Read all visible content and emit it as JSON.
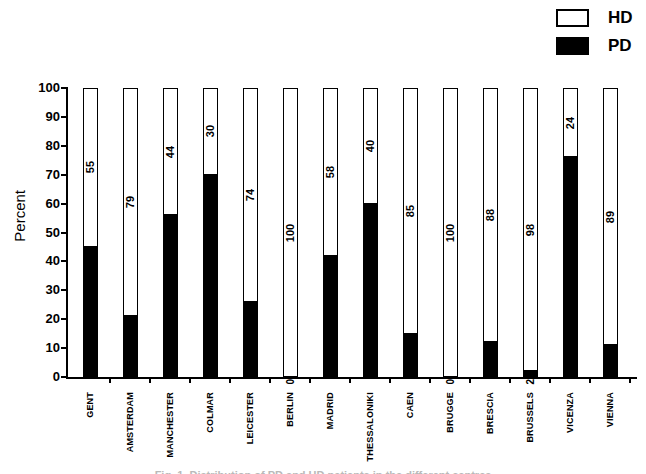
{
  "figure": {
    "legend": {
      "position": "top-right",
      "entries": [
        {
          "label": "HD",
          "fill": "#ffffff",
          "border": "#000000"
        },
        {
          "label": "PD",
          "fill": "#000000",
          "border": "#000000"
        }
      ]
    },
    "caption_clipped": "Fig. 1. Distribution of PD and HD patients in the different centres"
  },
  "chart_data": {
    "type": "bar",
    "stacked": true,
    "orientation": "vertical",
    "title": "",
    "xlabel": "",
    "ylabel": "Percent",
    "ylim": [
      0,
      100
    ],
    "yticks": [
      0,
      10,
      20,
      30,
      40,
      50,
      60,
      70,
      80,
      90,
      100
    ],
    "grid": false,
    "legend_position": "top-right",
    "categories": [
      "GENT",
      "AMSTERDAM",
      "MANCHESTER",
      "COLMAR",
      "LEICESTER",
      "BERLIN",
      "MADRID",
      "THESSALONIKI",
      "CAEN",
      "BRUGGE",
      "BRESCIA",
      "BRUSSELS",
      "VICENZA",
      "VIENNA"
    ],
    "series": [
      {
        "name": "PD",
        "fill": "#000000",
        "values": [
          45,
          21,
          56,
          70,
          26,
          0,
          42,
          60,
          15,
          0,
          12,
          2,
          76,
          11
        ]
      },
      {
        "name": "HD",
        "fill": "#ffffff",
        "values": [
          55,
          79,
          44,
          30,
          74,
          100,
          58,
          40,
          85,
          100,
          88,
          98,
          24,
          89
        ]
      }
    ],
    "hd_segment_labels": [
      55,
      79,
      44,
      30,
      74,
      100,
      58,
      40,
      85,
      100,
      88,
      98,
      24,
      89
    ],
    "pd_value_labels": [
      null,
      null,
      null,
      null,
      null,
      "0",
      null,
      null,
      null,
      "0",
      null,
      "2",
      null,
      null
    ],
    "colors": {
      "pd": "#000000",
      "hd": "#ffffff",
      "axis": "#000000",
      "background": "#ffffff"
    }
  }
}
